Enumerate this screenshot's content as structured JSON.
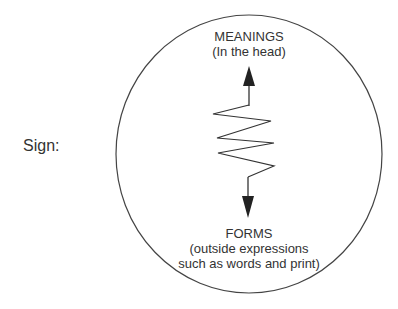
{
  "diagram": {
    "sign_label": "Sign:",
    "meanings": {
      "title": "MEANINGS",
      "subtitle": "(In the head)"
    },
    "forms": {
      "title": "FORMS",
      "subtitle_line1": "(outside expressions",
      "subtitle_line2": "such as words and print)"
    },
    "shapes": {
      "circle": "ellipse-boundary",
      "connector": "zigzag-line",
      "arrow_up": "arrow-up-to-meanings",
      "arrow_down": "arrow-down-to-forms"
    },
    "colors": {
      "stroke": "#333333",
      "text": "#333333",
      "background": "#ffffff"
    }
  }
}
